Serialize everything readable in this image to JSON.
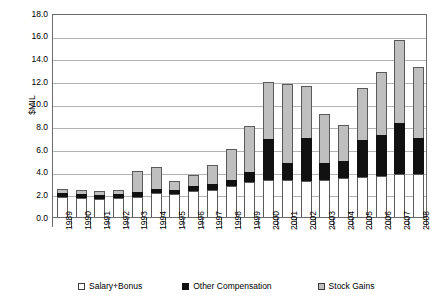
{
  "chart_data": {
    "type": "bar",
    "stacked": true,
    "title": "",
    "xlabel": "",
    "ylabel": "$MIL",
    "ylim": [
      0,
      18
    ],
    "ytick_step": 2,
    "ytick_labels": [
      "18.0",
      "16.0",
      "14.0",
      "12.0",
      "10.0",
      "8.0",
      "6.0",
      "4.0",
      "2.0",
      "0.0"
    ],
    "grid": true,
    "legend_position": "bottom",
    "categories": [
      "1989",
      "1990",
      "1991",
      "1992",
      "1993",
      "1994",
      "1995",
      "1996",
      "1997",
      "1998",
      "1999",
      "2000",
      "2001",
      "2002",
      "2003",
      "2004",
      "2005",
      "2006",
      "2007",
      "2008"
    ],
    "series": [
      {
        "name": "Salary+Bonus",
        "color": "#ffffff",
        "values": [
          1.8,
          1.7,
          1.6,
          1.7,
          1.8,
          2.1,
          2.0,
          2.3,
          2.4,
          2.7,
          3.1,
          3.3,
          3.3,
          3.2,
          3.3,
          3.4,
          3.5,
          3.6,
          3.8,
          3.8
        ]
      },
      {
        "name": "Other Compensation",
        "color": "#111111",
        "values": [
          0.3,
          0.3,
          0.3,
          0.3,
          0.4,
          0.4,
          0.4,
          0.4,
          0.5,
          0.6,
          0.9,
          3.6,
          1.5,
          3.8,
          1.5,
          1.5,
          3.3,
          3.6,
          4.5,
          3.2
        ]
      },
      {
        "name": "Stock Gains",
        "color": "#bfbfbf",
        "values": [
          0.4,
          0.4,
          0.4,
          0.4,
          1.9,
          1.9,
          0.8,
          1.0,
          1.7,
          2.7,
          4.0,
          5.0,
          6.9,
          4.6,
          4.3,
          3.2,
          4.6,
          5.6,
          7.3,
          6.2
        ]
      }
    ],
    "totals": [
      2.5,
      2.4,
      2.3,
      2.4,
      4.1,
      4.4,
      3.2,
      3.7,
      4.6,
      6.0,
      8.0,
      11.9,
      11.7,
      11.6,
      9.1,
      8.1,
      11.4,
      12.8,
      15.6,
      13.2
    ]
  },
  "legend": {
    "items": [
      {
        "label": "Salary+Bonus",
        "swatch": "salary"
      },
      {
        "label": "Other Compensation",
        "swatch": "other"
      },
      {
        "label": "Stock Gains",
        "swatch": "stock"
      }
    ]
  }
}
